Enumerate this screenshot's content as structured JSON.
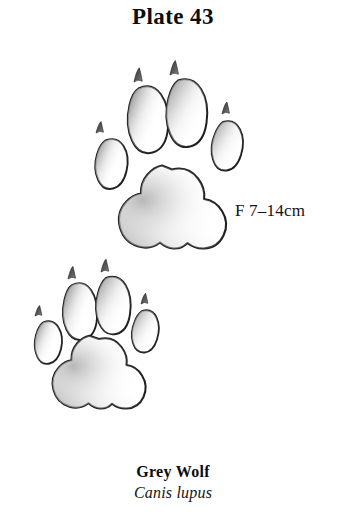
{
  "page": {
    "background_color": "#ffffff",
    "width": 346,
    "height": 512
  },
  "title": {
    "text": "Plate 43"
  },
  "figure": {
    "name": "wolf-track-illustration",
    "ink_color": "#1c1c1c",
    "shade_color": "#8e8e8e",
    "measurement": {
      "text": "F 7–14cm"
    },
    "tracks": [
      {
        "name": "front-track",
        "label": "F",
        "toe_count": 4,
        "claw_count": 4
      },
      {
        "name": "hind-track",
        "label": "H",
        "toe_count": 4,
        "claw_count": 4
      }
    ]
  },
  "caption": {
    "common_name": "Grey Wolf",
    "scientific_name": "Canis lupus"
  }
}
